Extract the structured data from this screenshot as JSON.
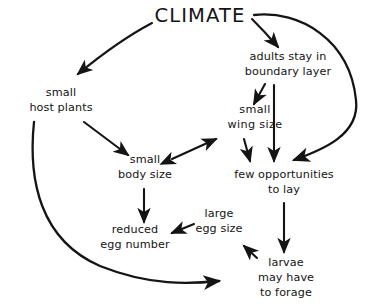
{
  "diagram": {
    "title": "CLIMATE",
    "colors": {
      "background": "#ffffff",
      "ink": "#141414"
    },
    "nodes": [
      {
        "id": "climate",
        "lines": [
          "CLIMATE"
        ]
      },
      {
        "id": "adults-stay",
        "lines": [
          "adults stay in",
          "boundary  layer"
        ]
      },
      {
        "id": "small-host",
        "lines": [
          "small",
          "host plants"
        ]
      },
      {
        "id": "small-wing",
        "lines": [
          "small",
          "wing  size"
        ]
      },
      {
        "id": "small-body",
        "lines": [
          "small",
          "body size"
        ]
      },
      {
        "id": "few-opps",
        "lines": [
          "few opportunities",
          "to lay"
        ]
      },
      {
        "id": "reduced-eggs",
        "lines": [
          "reduced",
          "egg number"
        ]
      },
      {
        "id": "large-egg",
        "lines": [
          "large",
          "egg size"
        ]
      },
      {
        "id": "larvae-forage",
        "lines": [
          "larvae",
          "may have",
          "to forage"
        ]
      }
    ],
    "edges": [
      {
        "id": "climate-to-host",
        "from": "climate",
        "to": "small-host",
        "style": "curved",
        "heads": "single"
      },
      {
        "id": "climate-to-adults",
        "from": "climate",
        "to": "adults-stay",
        "style": "curved",
        "heads": "single"
      },
      {
        "id": "climate-to-few-opps",
        "from": "climate",
        "to": "few-opps",
        "style": "long-curve",
        "heads": "single"
      },
      {
        "id": "adults-to-wing",
        "from": "adults-stay",
        "to": "small-wing",
        "style": "straight",
        "heads": "single"
      },
      {
        "id": "adults-to-few-opps",
        "from": "adults-stay",
        "to": "few-opps",
        "style": "straight",
        "heads": "single"
      },
      {
        "id": "wing-to-few-opps",
        "from": "small-wing",
        "to": "few-opps",
        "style": "straight",
        "heads": "single"
      },
      {
        "id": "host-to-body",
        "from": "small-host",
        "to": "small-body",
        "style": "straight",
        "heads": "single"
      },
      {
        "id": "body-wing-bidirectional",
        "from": "small-body",
        "to": "small-wing",
        "style": "straight",
        "heads": "double"
      },
      {
        "id": "body-to-eggs",
        "from": "small-body",
        "to": "reduced-eggs",
        "style": "straight",
        "heads": "single"
      },
      {
        "id": "large-egg-to-reduced",
        "from": "large-egg",
        "to": "reduced-eggs",
        "style": "straight",
        "heads": "single"
      },
      {
        "id": "few-opps-to-larvae",
        "from": "few-opps",
        "to": "larvae-forage",
        "style": "straight",
        "heads": "single"
      },
      {
        "id": "larvae-to-upleft",
        "from": "larvae-forage",
        "to": "reduced-eggs",
        "style": "short-arrow",
        "heads": "single"
      },
      {
        "id": "host-to-larvae-curve",
        "from": "small-host",
        "to": "larvae-forage",
        "style": "long-curve",
        "heads": "single"
      }
    ]
  }
}
